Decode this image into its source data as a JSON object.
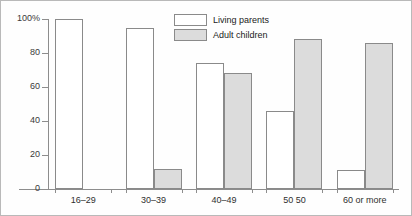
{
  "chart_data": {
    "type": "bar",
    "title": "",
    "subtitle": "",
    "xlabel": "",
    "ylabel": "",
    "ylim": [
      0,
      100
    ],
    "yticks": [
      0,
      20,
      40,
      60,
      80,
      100
    ],
    "ytick_labels": [
      "0",
      "20",
      "40",
      "60",
      "80",
      "100%"
    ],
    "grid": false,
    "legend_position": "top-center",
    "categories": [
      "16–29",
      "30–39",
      "40–49",
      "50 50",
      "60 or more"
    ],
    "series": [
      {
        "name": "Living parents",
        "color": "#ffffff",
        "edge_color": "#8a8a8a",
        "values": [
          100,
          95,
          74,
          46,
          11
        ]
      },
      {
        "name": "Adult children",
        "color": "#dcdcdc",
        "edge_color": "#8a8a8a",
        "values": [
          0,
          12,
          68,
          88,
          86
        ]
      }
    ]
  },
  "legend": {
    "items": [
      {
        "label": "Living parents",
        "swatch": "white-swatch"
      },
      {
        "label": "Adult children",
        "swatch": "gray-swatch"
      }
    ]
  },
  "axes": {
    "y_tick_labels": [
      "100%",
      "80",
      "60",
      "40",
      "20",
      "0"
    ],
    "x_tick_labels": [
      "16–29",
      "30–39",
      "40–49",
      "50 50",
      "60 or more"
    ]
  },
  "colors": {
    "bar_living": "#ffffff",
    "bar_children": "#dcdcdc",
    "bar_edge": "#8a8a8a",
    "axis": "#8d8d8d",
    "frame": "#b9b9b9",
    "text": "#2b2b2b",
    "background": "#fefefe"
  }
}
